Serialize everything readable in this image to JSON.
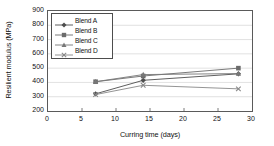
{
  "chart_data": {
    "type": "line",
    "title": "",
    "xlabel": "Curring time (days)",
    "ylabel": "Resilient modulus (MPa)",
    "xlim": [
      0,
      30
    ],
    "ylim": [
      200,
      900
    ],
    "xticks": [
      0,
      5,
      10,
      15,
      20,
      25,
      30
    ],
    "yticks": [
      200,
      300,
      400,
      500,
      600,
      700,
      800,
      900
    ],
    "grid": "horizontal",
    "legend_position": "upper-left-inside",
    "x": [
      7,
      14,
      28
    ],
    "series": [
      {
        "name": "Blend A",
        "marker": "diamond",
        "color": "#4d4d4d",
        "values": [
          320,
          415,
          460
        ]
      },
      {
        "name": "Blend B",
        "marker": "square",
        "color": "#6b6b6b",
        "values": [
          405,
          445,
          500
        ]
      },
      {
        "name": "Blend C",
        "marker": "triangle",
        "color": "#777777",
        "values": [
          405,
          455,
          462
        ]
      },
      {
        "name": "Blend D",
        "marker": "cross",
        "color": "#888888",
        "values": [
          315,
          380,
          355
        ]
      }
    ]
  },
  "axes": {
    "y_tick_labels": [
      "900",
      "800",
      "700",
      "600",
      "500",
      "400",
      "300",
      "200"
    ],
    "x_tick_labels": [
      "0",
      "5",
      "10",
      "15",
      "20",
      "25",
      "30"
    ],
    "y_title": "Resilient modulus (MPa)",
    "x_title": "Curring time (days)"
  },
  "legend": {
    "items": [
      {
        "label": "Blend A"
      },
      {
        "label": "Blend B"
      },
      {
        "label": "Blend C"
      },
      {
        "label": "Blend D"
      }
    ]
  },
  "style": {
    "frame_color": "#5a5a5a",
    "grid_color": "#d9d9d9",
    "background": "#ffffff"
  }
}
